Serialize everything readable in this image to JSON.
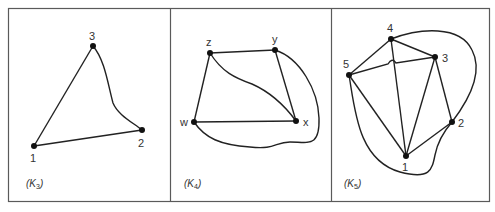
{
  "figure": {
    "panels": [
      {
        "id": "k3",
        "caption_main": "K",
        "caption_sub": "3",
        "nodes": [
          {
            "id": "1",
            "label": "1",
            "x": 34,
            "y": 146
          },
          {
            "id": "2",
            "label": "2",
            "x": 142,
            "y": 130
          },
          {
            "id": "3",
            "label": "3",
            "x": 93,
            "y": 46
          }
        ],
        "edges": [
          [
            "1",
            "3"
          ],
          [
            "1",
            "2"
          ],
          [
            "3",
            "2"
          ]
        ]
      },
      {
        "id": "k4",
        "caption_main": "K",
        "caption_sub": "4",
        "nodes": [
          {
            "id": "z",
            "label": "z",
            "x": 210,
            "y": 53
          },
          {
            "id": "y",
            "label": "y",
            "x": 275,
            "y": 50
          },
          {
            "id": "w",
            "label": "w",
            "x": 194,
            "y": 122
          },
          {
            "id": "x",
            "label": "x",
            "x": 296,
            "y": 121
          }
        ],
        "edges": [
          [
            "z",
            "y"
          ],
          [
            "z",
            "w"
          ],
          [
            "w",
            "x"
          ],
          [
            "y",
            "x"
          ],
          [
            "z",
            "x"
          ],
          [
            "y",
            "w"
          ]
        ]
      },
      {
        "id": "k5",
        "caption_main": "K",
        "caption_sub": "5",
        "nodes": [
          {
            "id": "1",
            "label": "1",
            "x": 406,
            "y": 156
          },
          {
            "id": "2",
            "label": "2",
            "x": 452,
            "y": 122
          },
          {
            "id": "3",
            "label": "3",
            "x": 435,
            "y": 57
          },
          {
            "id": "4",
            "label": "4",
            "x": 391,
            "y": 39
          },
          {
            "id": "5",
            "label": "5",
            "x": 349,
            "y": 75
          }
        ],
        "edges": [
          [
            "4",
            "5"
          ],
          [
            "4",
            "3"
          ],
          [
            "4",
            "1"
          ],
          [
            "5",
            "3"
          ],
          [
            "5",
            "1"
          ],
          [
            "3",
            "1"
          ],
          [
            "3",
            "2"
          ],
          [
            "1",
            "2"
          ],
          [
            "4",
            "2"
          ],
          [
            "5",
            "2"
          ]
        ]
      }
    ]
  }
}
